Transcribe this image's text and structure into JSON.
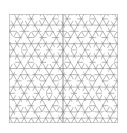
{
  "image": {
    "description": "Square tile of a hexagram (star-of-David) lattice pattern, grey lines on white",
    "pattern": "hexagram-lattice",
    "line_color": "#8a8a8a",
    "background_color": "#ffffff",
    "border_color": "#b0b0b0",
    "has_center_divider": true
  }
}
